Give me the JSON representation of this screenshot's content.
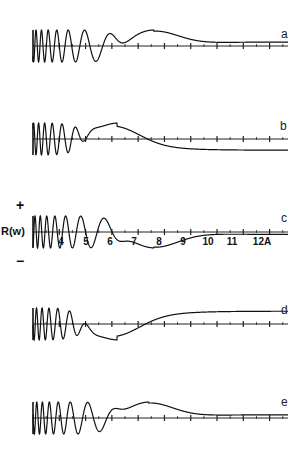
{
  "chart_data": {
    "type": "line",
    "title": "",
    "xlabel": "Å",
    "ylabel": "R(w)",
    "x_ticks": [
      4,
      5,
      6,
      7,
      8,
      9,
      10,
      11,
      12
    ],
    "x_tick_labels": [
      "4",
      "5",
      "6",
      "7",
      "8",
      "9",
      "10",
      "11",
      "12A"
    ],
    "y_signs": {
      "plus": "+",
      "minus": "−"
    },
    "xlim": [
      3,
      12.7
    ],
    "grid": false,
    "panels": [
      {
        "label": "a",
        "axis_y": 46,
        "tail": "positive peak near 7.5 then decays toward 0 from above",
        "phase": 0.0,
        "tail_sign": 1,
        "tail_peak_x": 7.6,
        "tail_end": 0.25
      },
      {
        "label": "b",
        "axis_y": 139,
        "tail": "positive peak near 6.2 then crosses to negative plateau",
        "phase": 1.0,
        "tail_sign": 1,
        "tail_peak_x": 6.2,
        "tail_end": -0.7
      },
      {
        "label": "c",
        "axis_y": 232,
        "tail": "positive peak near 5.7, negative minimum near 7.6, rising toward 0",
        "phase": 1.6,
        "tail_sign": -1,
        "tail_peak_x": 7.6,
        "tail_end": -0.15
      },
      {
        "label": "d",
        "axis_y": 324,
        "tail": "negative minimum near 6.2 then rises to positive plateau",
        "phase": 2.2,
        "tail_sign": -1,
        "tail_peak_x": 6.2,
        "tail_end": 0.8
      },
      {
        "label": "e",
        "axis_y": 418,
        "tail": "positive peak near 7.4 then decays toward 0",
        "phase": 0.3,
        "tail_sign": 1,
        "tail_peak_x": 7.4,
        "tail_end": 0.2
      }
    ]
  },
  "labels": {
    "panel_a": "a",
    "panel_b": "b",
    "panel_c": "c",
    "panel_d": "d",
    "panel_e": "e",
    "y_axis": "R(w)",
    "plus": "+",
    "minus": "−",
    "ticks": [
      "4",
      "5",
      "6",
      "7",
      "8",
      "9",
      "10",
      "11",
      "12A"
    ]
  }
}
